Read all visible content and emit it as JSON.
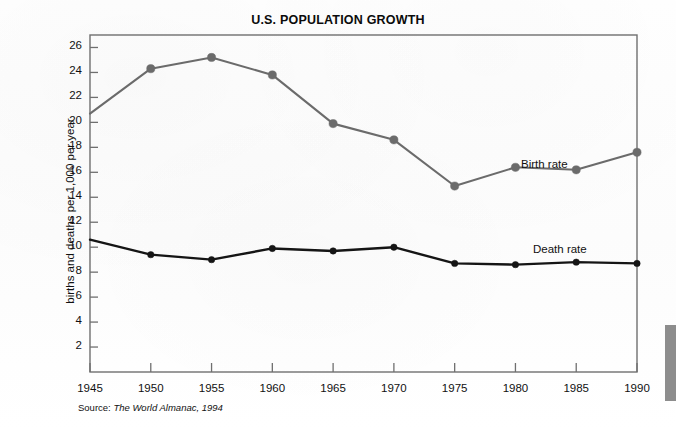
{
  "document": {
    "title": "U.S. POPULATION GROWTH",
    "source_prefix": "Source:",
    "source_work": "The World Almanac, 1994"
  },
  "colors": {
    "birth_rate_line": "#6b6b6b",
    "death_rate_line": "#151515",
    "axis": "#6f6f6f",
    "text": "#111111",
    "page_background": "#ffffff",
    "edge_artifact": "#8d8d8d"
  },
  "axes": {
    "y_title": "births and deaths per 1,000 per year",
    "y_ticks": [
      "2",
      "4",
      "6",
      "8",
      "10",
      "12",
      "14",
      "16",
      "18",
      "20",
      "22",
      "24",
      "26"
    ],
    "x_ticks": [
      "1945",
      "1950",
      "1955",
      "1960",
      "1965",
      "1970",
      "1975",
      "1980",
      "1985",
      "1990"
    ]
  },
  "legend": {
    "birth_rate_label": "Birth rate",
    "death_rate_label": "Death rate"
  },
  "chart_data": {
    "type": "line",
    "title": "U.S. POPULATION GROWTH",
    "xlabel": "",
    "ylabel": "births and deaths per 1,000 per year",
    "x": [
      1945,
      1950,
      1955,
      1960,
      1965,
      1970,
      1975,
      1980,
      1985,
      1990
    ],
    "xlim": [
      1945,
      1990
    ],
    "ylim": [
      0,
      27
    ],
    "y_ticks": [
      2,
      4,
      6,
      8,
      10,
      12,
      14,
      16,
      18,
      20,
      22,
      24,
      26
    ],
    "grid": false,
    "legend_position": "inline-right",
    "source": "Source: The World Almanac, 1994",
    "series": [
      {
        "name": "Birth rate",
        "color": "#6b6b6b",
        "values": [
          20.7,
          24.3,
          25.2,
          23.8,
          19.9,
          18.6,
          14.9,
          16.4,
          16.2,
          17.6
        ],
        "marker_start_index": 1
      },
      {
        "name": "Death rate",
        "color": "#151515",
        "values": [
          10.6,
          9.4,
          9.0,
          9.9,
          9.7,
          10.0,
          8.7,
          8.6,
          8.8,
          8.7
        ],
        "marker_start_index": 1
      }
    ]
  }
}
